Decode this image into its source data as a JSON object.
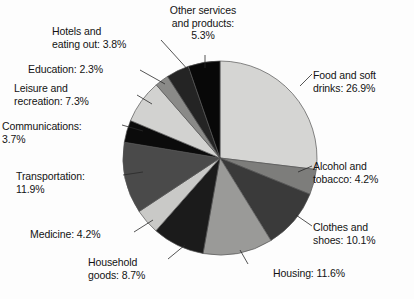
{
  "chart_data": {
    "type": "pie",
    "title": "",
    "subtitle": "",
    "xlabel": "",
    "ylabel": "",
    "legend_position": "none",
    "labels_outside": true,
    "start_angle_deg": 0,
    "direction": "clockwise",
    "units": "%",
    "categories": [
      "Food and soft drinks",
      "Alcohol and tobacco",
      "Clothes and shoes",
      "Housing",
      "Household goods",
      "Medicine",
      "Transportation",
      "Communications",
      "Leisure and recreation",
      "Education",
      "Hotels and eating out",
      "Other services and products"
    ],
    "values": [
      26.9,
      4.2,
      10.1,
      11.6,
      8.7,
      4.2,
      11.9,
      3.7,
      7.3,
      2.3,
      3.8,
      5.3
    ],
    "colors": [
      "#d5d5d3",
      "#7d7d7b",
      "#3a3a3a",
      "#9a9a98",
      "#1b1b1b",
      "#c9c9c7",
      "#4a4a4a",
      "#0b0b0b",
      "#d2d2d0",
      "#8a8a88",
      "#242424",
      "#080808"
    ],
    "slices": [
      {
        "id": "food",
        "label": "Food and soft drinks",
        "value": 26.9,
        "color": "#d5d5d3"
      },
      {
        "id": "alcohol",
        "label": "Alcohol and tobacco",
        "value": 4.2,
        "color": "#7d7d7b"
      },
      {
        "id": "clothes",
        "label": "Clothes and shoes",
        "value": 10.1,
        "color": "#3a3a3a"
      },
      {
        "id": "housing",
        "label": "Housing",
        "value": 11.6,
        "color": "#9a9a98"
      },
      {
        "id": "household",
        "label": "Household goods",
        "value": 8.7,
        "color": "#1b1b1b"
      },
      {
        "id": "medicine",
        "label": "Medicine",
        "value": 4.2,
        "color": "#c9c9c7"
      },
      {
        "id": "transport",
        "label": "Transportation",
        "value": 11.9,
        "color": "#4a4a4a"
      },
      {
        "id": "comms",
        "label": "Communications",
        "value": 3.7,
        "color": "#0b0b0b"
      },
      {
        "id": "leisure",
        "label": "Leisure and recreation",
        "value": 7.3,
        "color": "#d2d2d0"
      },
      {
        "id": "education",
        "label": "Education",
        "value": 2.3,
        "color": "#8a8a88"
      },
      {
        "id": "hotels",
        "label": "Hotels and eating out",
        "value": 3.8,
        "color": "#242424"
      },
      {
        "id": "other",
        "label": "Other services and products",
        "value": 5.3,
        "color": "#080808"
      }
    ]
  },
  "labels": {
    "food": "Food and soft\ndrinks: 26.9%",
    "alcohol": "Alcohol and\ntobacco: 4.2%",
    "clothes": "Clothes and\nshoes: 10.1%",
    "housing": "Housing: 11.6%",
    "household": "Household\ngoods: 8.7%",
    "medicine": "Medicine: 4.2%",
    "transport": "Transportation:\n11.9%",
    "comms": "Communications:\n3.7%",
    "leisure": "Leisure and\nrecreation: 7.3%",
    "education": "Education: 2.3%",
    "hotels": "Hotels and\neating out: 3.8%",
    "other": "Other services\nand products:\n5.3%"
  },
  "geometry": {
    "center_x": 220,
    "center_y": 158,
    "radius": 97,
    "outline_color": "#555555"
  }
}
